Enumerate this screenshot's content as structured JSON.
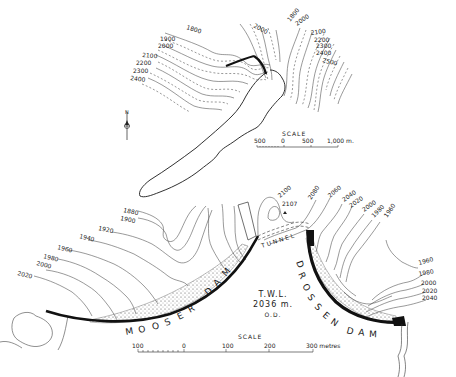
{
  "upper_map": {
    "contours_left": [
      "1800",
      "1900",
      "2000",
      "2100",
      "2200",
      "2300",
      "2400"
    ],
    "contours_top": [
      "2000",
      "1800",
      "2000"
    ],
    "contours_right": [
      "2100",
      "2200",
      "2300",
      "2400",
      "2500"
    ],
    "north_label": "N",
    "scale": {
      "title": "SCALE",
      "ticks": [
        "500",
        "0",
        "500",
        "1,000 m."
      ]
    }
  },
  "lower_map": {
    "contours_left": [
      "1880",
      "1900",
      "1920",
      "1940",
      "1960",
      "1980",
      "2000",
      "2020"
    ],
    "contours_center": [
      "2100",
      "2107",
      "2080",
      "2060"
    ],
    "contours_right_upper": [
      "2040",
      "2020",
      "2000",
      "1980",
      "1960"
    ],
    "contours_right_lower": [
      "1960",
      "1980",
      "2000",
      "2020",
      "2040"
    ],
    "tunnel_label": "TUNNEL",
    "dams": [
      {
        "name": "MOOSER DAM"
      },
      {
        "name": "DROSSEN DAM"
      }
    ],
    "twl": {
      "line1": "T.W.L.",
      "line2": "2036 m.",
      "line3": "O.D."
    },
    "scale": {
      "title": "SCALE",
      "ticks": [
        "100",
        "0",
        "100",
        "200",
        "300 metres"
      ]
    }
  }
}
